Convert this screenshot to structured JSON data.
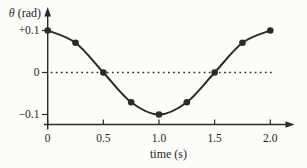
{
  "figure": {
    "background": "#fcfcf9",
    "ink_color": "#2a2a2a",
    "text_color": "#1e1e1e"
  },
  "chart_data": {
    "type": "line",
    "title": "",
    "xlabel": "time (s)",
    "ylabel": "θ (rad)",
    "ylabel_symbol": "θ",
    "ylabel_rest": " (rad)",
    "x": [
      0,
      0.25,
      0.5,
      0.75,
      1.0,
      1.25,
      1.5,
      1.75,
      2.0
    ],
    "y": [
      0.1,
      0.0707,
      0,
      -0.0707,
      -0.1,
      -0.0707,
      0,
      0.0707,
      0.1
    ],
    "x_ticks": [
      0,
      0.5,
      1.0,
      1.5,
      2.0
    ],
    "x_tick_labels": [
      "0",
      "0.5",
      "1.0",
      "1.5",
      "2.0"
    ],
    "y_ticks": [
      0.1,
      0,
      -0.1
    ],
    "y_tick_labels": [
      "+0.1",
      "0",
      "−0.1"
    ],
    "xlim": [
      0,
      2.2
    ],
    "ylim": [
      -0.13,
      0.15
    ],
    "zero_line_style": "dotted",
    "line_style": "smooth",
    "marker": "filled-circle",
    "grid": false,
    "legend": false,
    "amplitude": 0.1,
    "period_s": 2.0
  }
}
